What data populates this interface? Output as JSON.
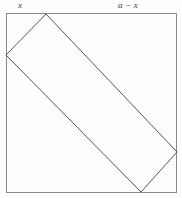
{
  "figure": {
    "name": "inscribed-rectangle-in-square",
    "background_color": "#fefefe",
    "labels": {
      "left_segment": "x",
      "right_segment": "a − x"
    },
    "colors": {
      "square_stroke": "#8a8a8a",
      "rectangle_stroke": "#555555",
      "label_text": "#3a3a3a"
    },
    "geometry": {
      "square": {
        "x": 6,
        "y": 13,
        "width": 171,
        "height": 180,
        "stroke_width": 1
      },
      "rectangle_vertices": [
        {
          "name": "top",
          "x": 46,
          "y": 14
        },
        {
          "name": "right",
          "x": 177,
          "y": 152
        },
        {
          "name": "bottom",
          "x": 141,
          "y": 192
        },
        {
          "name": "left",
          "x": 6,
          "y": 55
        }
      ],
      "rectangle_stroke_width": 1
    }
  }
}
